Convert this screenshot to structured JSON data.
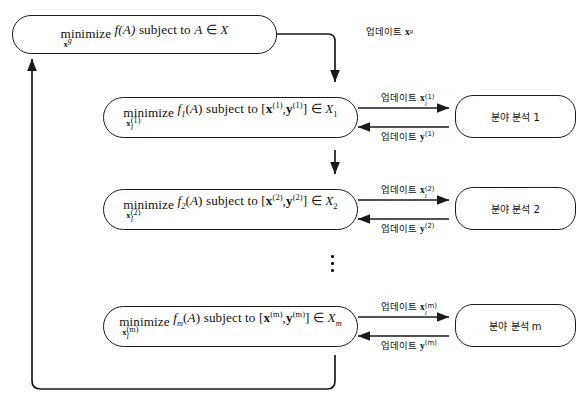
{
  "diagram": {
    "type": "hierarchical-decomposition-flowchart",
    "canvas": {
      "width": 586,
      "height": 405,
      "background": "#ffffff",
      "line_color": "#1a1a1a"
    },
    "global_node": {
      "minimize_word": "minimize",
      "minimize_subscript_var": "x",
      "minimize_subscript_sub": "g",
      "objective": "f(",
      "objective_arg": "A",
      "objective_close": ")",
      "connector": "subject to",
      "member_left": "A",
      "member_symbol": "∈",
      "member_right": "X",
      "full_text": "minimize_{x_g} f(A) subject to A ∈ X"
    },
    "global_update_label": {
      "prefix": "업데이트",
      "var": "x",
      "sub": "g",
      "full_text": "업데이트 x_g"
    },
    "subproblems": [
      {
        "id": "sub-1",
        "index_label": "1",
        "minimize_word": "minimize",
        "minimize_subscript_var": "x",
        "minimize_subscript_sub": "l",
        "minimize_subscript_sup": "(1)",
        "objective": "f",
        "objective_index": "1",
        "objective_arg": "A",
        "connector": "subject to",
        "vector_x": "x",
        "vector_y": "y",
        "vector_sup": "(1)",
        "member_symbol": "∈",
        "feasible_set": "X",
        "feasible_set_sub": "1",
        "full_text": "minimize_{x_l^{(1)}} f_1(A) subject to [x^{(1)}, y^{(1)}] ∈ X_1",
        "analysis_label": "분야 분석 1",
        "update_out": {
          "prefix": "업데이트",
          "var": "x",
          "sub": "l",
          "sup": "(1)",
          "full_text": "업데이트 x_l^{(1)}"
        },
        "update_in": {
          "prefix": "업데이트",
          "var": "y",
          "sup": "(1)",
          "full_text": "업데이트 y^{(1)}"
        }
      },
      {
        "id": "sub-2",
        "index_label": "2",
        "minimize_word": "minimize",
        "minimize_subscript_var": "x",
        "minimize_subscript_sub": "l",
        "minimize_subscript_sup": "(2)",
        "objective": "f",
        "objective_index": "2",
        "objective_arg": "A",
        "connector": "subject to",
        "vector_x": "x",
        "vector_y": "y",
        "vector_sup": "(2)",
        "member_symbol": "∈",
        "feasible_set": "X",
        "feasible_set_sub": "2",
        "full_text": "minimize_{x_l^{(2)}} f_2(A) subject to [x^{(2)}, y^{(2)}] ∈ X_2",
        "analysis_label": "분야 분석 2",
        "update_out": {
          "prefix": "업데이트",
          "var": "x",
          "sub": "l",
          "sup": "(2)",
          "full_text": "업데이트 x_l^{(2)}"
        },
        "update_in": {
          "prefix": "업데이트",
          "var": "y",
          "sup": "(2)",
          "full_text": "업데이트 y^{(2)}"
        }
      },
      {
        "id": "sub-m",
        "index_label": "m",
        "minimize_word": "minimize",
        "minimize_subscript_var": "x",
        "minimize_subscript_sub": "l",
        "minimize_subscript_sup": "(m)",
        "objective": "f",
        "objective_index": "m",
        "objective_arg": "A",
        "connector": "subject to",
        "vector_x": "x",
        "vector_y": "y",
        "vector_sup": "(m)",
        "member_symbol": "∈",
        "feasible_set": "X",
        "feasible_set_sub": "m",
        "full_text": "minimize_{x_l^{(m)}} f_m(A) subject to [x^{(m)}, y^{(m)}] ∈ X_m",
        "analysis_label": "분야 분석 m",
        "update_out": {
          "prefix": "업데이트",
          "var": "x",
          "sub": "l",
          "sup": "(m)",
          "full_text": "업데이트 x_l^{(m)}"
        },
        "update_in": {
          "prefix": "업데이트",
          "var": "y",
          "sup": "(m)",
          "full_text": "업데이트 y^{(m)}"
        }
      }
    ],
    "ellipsis": {
      "symbol": "⋮",
      "meaning": "vertical-dots-between-sub-2-and-sub-m"
    }
  }
}
